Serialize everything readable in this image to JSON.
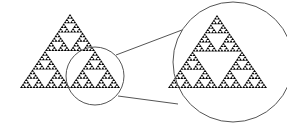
{
  "diagram": {
    "colors": {
      "fill": "#000000",
      "stroke": "#555555",
      "background": "#ffffff"
    },
    "main_triangle": {
      "apex": [
        70,
        14
      ],
      "left": [
        20,
        88
      ],
      "right": [
        120,
        88
      ],
      "depth": 5
    },
    "lens": {
      "cx": 95,
      "cy": 76,
      "r": 29
    },
    "magnified_circle": {
      "cx": 233,
      "cy": 62,
      "r": 60
    },
    "magnified_triangle": {
      "apex": [
        217,
        15
      ],
      "left": [
        168,
        88
      ],
      "right": [
        267,
        88
      ],
      "depth": 5
    },
    "connector_lines": [
      [
        116,
        55,
        182,
        30
      ],
      [
        118,
        96,
        178,
        104
      ]
    ]
  }
}
